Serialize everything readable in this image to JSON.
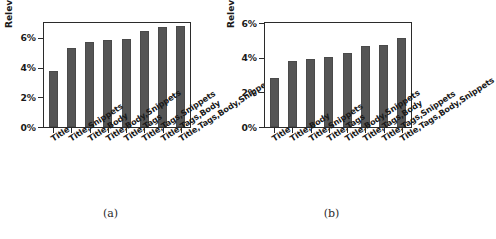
{
  "figure": {
    "ylabel": "Relevant results retrieved",
    "panels": [
      {
        "caption": "(a)",
        "chart_data": {
          "type": "bar",
          "title": "",
          "xlabel": "",
          "ylabel": "Relevant results retrieved",
          "ylim": [
            0,
            7
          ],
          "yticks": [
            "0%",
            "2%",
            "4%",
            "6%"
          ],
          "ytick_values": [
            0,
            2,
            4,
            6
          ],
          "grid": false,
          "legend": null,
          "bar_color": "#555555",
          "categories": [
            "Title",
            "Title,Snippets",
            "Title,Body",
            "Title,Body,Snippets",
            "Title,Tags",
            "Title,Tags,Snippets",
            "Title,Tags,Body",
            "Title,Tags,Body,Snippets"
          ],
          "values": [
            3.8,
            5.35,
            5.75,
            5.85,
            5.9,
            6.45,
            6.7,
            6.8
          ]
        }
      },
      {
        "caption": "(b)",
        "chart_data": {
          "type": "bar",
          "title": "",
          "xlabel": "",
          "ylabel": "Relevant results retrieved",
          "ylim": [
            0,
            6
          ],
          "yticks": [
            "0%",
            "2%",
            "4%",
            "6%"
          ],
          "ytick_values": [
            0,
            2,
            4,
            6
          ],
          "grid": false,
          "legend": null,
          "bar_color": "#555555",
          "categories": [
            "Title",
            "Title,Body",
            "Title,Snippets",
            "Title,Tags",
            "Title,Body,Snippets",
            "Title,Tags,Body",
            "Title,Tags,Snippets",
            "Title,Tags,Body,Snippets"
          ],
          "values": [
            2.8,
            3.8,
            3.95,
            4.05,
            4.25,
            4.7,
            4.75,
            5.15
          ]
        }
      }
    ]
  }
}
